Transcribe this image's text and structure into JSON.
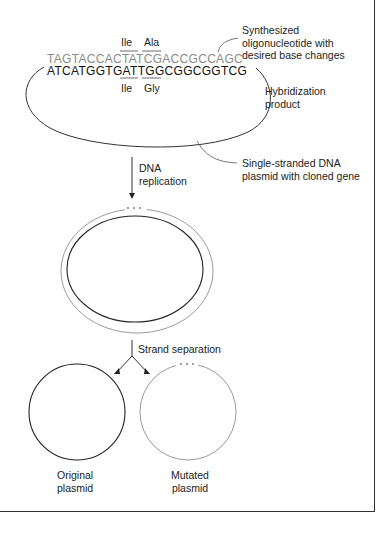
{
  "figure": {
    "sequences": {
      "oligo_strand": "TAGTACCACTATCGACCGCCAGC",
      "template_strand": "ATCATGGTGATTGGCGGCGGTCG"
    },
    "codons": {
      "mutant_top": [
        "Ile",
        "Ala"
      ],
      "original_bottom": [
        "Ile",
        "Gly"
      ]
    },
    "labels": {
      "oligo": [
        "Synthesized",
        "oligonucleotide with",
        "desired base changes"
      ],
      "hybrid": [
        "Hybridization",
        "product"
      ],
      "ss_plasmid": [
        "Single-stranded DNA",
        "plasmid with cloned gene"
      ],
      "replication": [
        "DNA",
        "replication"
      ],
      "strand_sep": "Strand separation",
      "original": [
        "Original",
        "plasmid"
      ],
      "mutated": [
        "Mutated",
        "plasmid"
      ]
    },
    "colors": {
      "original_strand": "#222222",
      "new_strand": "#9a9a9a"
    }
  }
}
